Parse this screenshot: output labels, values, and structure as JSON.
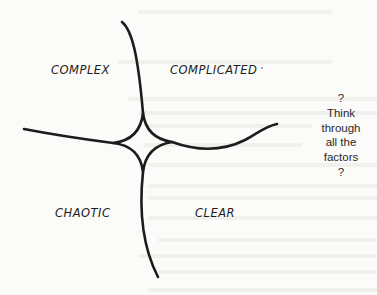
{
  "diagram": {
    "type": "sense-making framework (four domains)",
    "quadrants": {
      "top_left": "COMPLEX",
      "top_right": "COMPLICATED",
      "bottom_left": "CHAOTIC",
      "bottom_right": "CLEAR"
    },
    "side_note": {
      "lines": [
        "?",
        "Think",
        "through",
        "all the",
        "factors",
        "?"
      ]
    },
    "colors": {
      "background": "#fbfbf9",
      "ink": "#1c1c1c",
      "note_text": "#2a2a2a"
    }
  }
}
